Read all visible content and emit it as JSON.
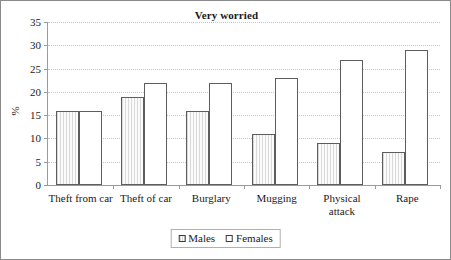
{
  "chart_data": {
    "type": "bar",
    "title": "Very worried",
    "xlabel": "",
    "ylabel": "%",
    "ylim": [
      0,
      35
    ],
    "yticks": [
      0,
      5,
      10,
      15,
      20,
      25,
      30,
      35
    ],
    "grid": true,
    "legend_position": "bottom-center",
    "categories": [
      "Theft from car",
      "Theft of car",
      "Burglary",
      "Mugging",
      "Physical attack",
      "Rape"
    ],
    "series": [
      {
        "name": "Males",
        "values": [
          16,
          19,
          16,
          11,
          9,
          7
        ]
      },
      {
        "name": "Females",
        "values": [
          16,
          22,
          22,
          23,
          26.8,
          29
        ]
      }
    ]
  },
  "legend": {
    "items": [
      {
        "label": "Males"
      },
      {
        "label": "Females"
      }
    ]
  }
}
